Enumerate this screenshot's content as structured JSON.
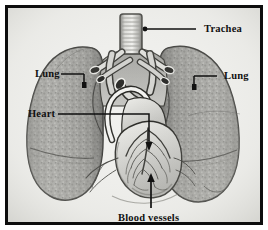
{
  "figure": {
    "style": "vintage grayscale engraving",
    "frame_color": "#0d0d0d",
    "plate_color": "#efefec"
  },
  "labels": [
    {
      "id": "trachea",
      "text": "Trachea",
      "leader": "horizontal-line-with-dot-left",
      "points_to": "trachea-tube"
    },
    {
      "id": "lung_left",
      "text": "Lung",
      "leader": "horizontal-line-with-bracket-right",
      "points_to": "left-lung-upper-lobe"
    },
    {
      "id": "lung_right",
      "text": "Lung",
      "leader": "horizontal-line-with-bracket-left",
      "points_to": "right-lung-upper-lobe"
    },
    {
      "id": "heart",
      "text": "Heart",
      "leader": "horizontal-then-down-arrow",
      "points_to": "heart-muscle"
    },
    {
      "id": "blood_vessels",
      "text": "Blood vessels",
      "leader": "vertical-up-arrow",
      "points_to": "coronary-vessel-network"
    }
  ],
  "anatomy": {
    "parts": [
      "trachea",
      "left-primary-bronchus",
      "right-primary-bronchus",
      "left-lung",
      "right-lung",
      "heart",
      "aortic-arch",
      "pulmonary-artery",
      "superior-vena-cava",
      "coronary-vessels",
      "diaphragmatic-surface"
    ],
    "tones": {
      "lung_fill": "#a3a3a0",
      "lung_shadow": "#6d6d6a",
      "vessel_fill": "#cfcfcb",
      "heart_fill": "#d8d8d4",
      "outline": "#2a2a28"
    }
  }
}
